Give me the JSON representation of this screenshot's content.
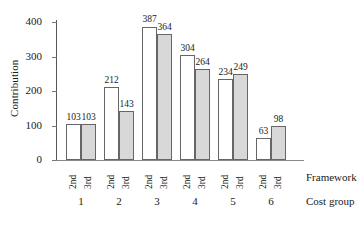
{
  "chart_data": {
    "type": "bar",
    "title": "",
    "xlabel": "Cost group",
    "ylabel": "Contribution",
    "ylim": [
      0,
      420
    ],
    "yticks": [
      0,
      100,
      200,
      300,
      400
    ],
    "ytick_labels": [
      "0",
      "100",
      "200",
      "300",
      "400"
    ],
    "grid": false,
    "legend": "none",
    "categories": [
      "1",
      "2",
      "3",
      "4",
      "5",
      "6"
    ],
    "group_row_label": "Framework",
    "category_row_label": "Cost group",
    "subcategories": [
      "2nd",
      "3rd"
    ],
    "series": [
      {
        "name": "2nd",
        "values": [
          103,
          212,
          387,
          304,
          234,
          63
        ],
        "fill": "#ffffff",
        "stroke": "#666666"
      },
      {
        "name": "3rd",
        "values": [
          103,
          143,
          364,
          264,
          249,
          98
        ],
        "fill": "#d8d8d8",
        "stroke": "#666666"
      }
    ],
    "data_labels": {
      "2nd": [
        "103",
        "212",
        "387",
        "304",
        "234",
        "63"
      ],
      "3rd": [
        "103",
        "143",
        "364",
        "264",
        "249",
        "98"
      ]
    }
  },
  "axis": {
    "y_label": "Contribution",
    "ticks": [
      "0",
      "100",
      "200",
      "300",
      "400"
    ]
  },
  "colors": {
    "bar_2nd": "#ffffff",
    "bar_3rd": "#d8d8d8",
    "bar_stroke": "#666666",
    "axis": "#555555",
    "text": "#1a1a1a",
    "background": "#ffffff"
  }
}
